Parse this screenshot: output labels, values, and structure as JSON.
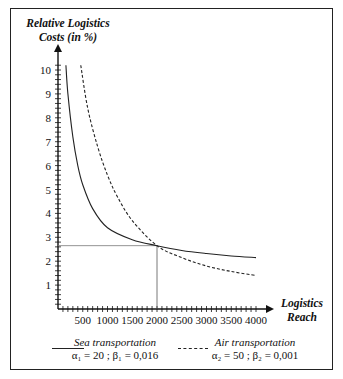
{
  "chart_data": {
    "type": "line",
    "title": "",
    "ylabel": "Relative Logistics Costs (in %)",
    "xlabel": "Logistics Reach",
    "xlim": [
      0,
      4000
    ],
    "ylim": [
      0,
      10
    ],
    "x_ticks": [
      500,
      1000,
      1500,
      2000,
      2500,
      3000,
      3500,
      4000
    ],
    "y_ticks": [
      1,
      2,
      3,
      4,
      5,
      6,
      7,
      8,
      9,
      10
    ],
    "grid": false,
    "legend_position": "bottom",
    "series": [
      {
        "name": "Sea transportation",
        "params": "α1 = 20 ; β1 = 0,016",
        "style": "solid",
        "x": [
          160,
          200,
          300,
          400,
          500,
          700,
          1000,
          1500,
          2000,
          2500,
          3000,
          3500,
          4000
        ],
        "y": [
          10.2,
          9.0,
          7.2,
          6.0,
          5.2,
          4.2,
          3.4,
          2.9,
          2.65,
          2.45,
          2.32,
          2.22,
          2.15
        ]
      },
      {
        "name": "Air transportation",
        "params": "α2 = 50 ; β2 = 0,001",
        "style": "dashed",
        "x": [
          460,
          600,
          800,
          1000,
          1200,
          1500,
          2000,
          2500,
          3000,
          3500,
          4000
        ],
        "y": [
          10.2,
          8.4,
          6.8,
          5.6,
          4.7,
          3.7,
          2.65,
          2.15,
          1.8,
          1.57,
          1.4
        ]
      }
    ],
    "annotations": [
      {
        "type": "reference-lines",
        "x": 2000,
        "y": 2.65,
        "note": "intersection of both curves"
      }
    ]
  },
  "labels": {
    "y_title_line1": "Relative Logistics",
    "y_title_line2": "Costs (in %)",
    "x_title_line1": "Logistics",
    "x_title_line2": "Reach"
  },
  "legend": {
    "sea_name": "Sea transportation",
    "sea_params": "α₁ = 20 ; β₁ = 0,016",
    "air_name": "Air transportation",
    "air_params": "α₂ = 50 ; β₂ = 0,001"
  }
}
